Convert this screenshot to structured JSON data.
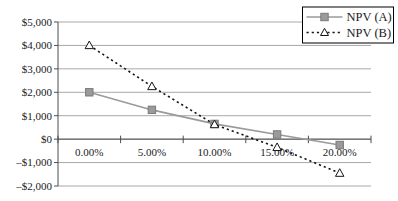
{
  "chart_data": {
    "type": "line",
    "title": "",
    "xlabel": "",
    "ylabel": "",
    "categories": [
      "0.00%",
      "5.00%",
      "10.00%",
      "15.00%",
      "20.00%"
    ],
    "series": [
      {
        "name": "NPV (A)",
        "values": [
          2000,
          1250,
          650,
          200,
          -250
        ],
        "color": "#9a9a9a",
        "marker_edge": "#7a7a7a",
        "line_style": "solid",
        "marker": "square-filled"
      },
      {
        "name": "NPV (B)",
        "values": [
          4000,
          2250,
          625,
          -350,
          -1450
        ],
        "color": "#141414",
        "marker_edge": "#141414",
        "marker_fill": "#ffffff",
        "line_style": "dotted",
        "marker": "triangle-open"
      }
    ],
    "ylim": [
      -2000,
      5000
    ],
    "ytick_step": 1000,
    "ytick_labels_top_to_bottom": [
      "$5,000",
      "$4,000",
      "$3,000",
      "$2,000",
      "$1,000",
      "$0",
      "–$1,000",
      "–$2,000"
    ],
    "grid": "horizontal-only",
    "legend_position": "top-right",
    "x_axis_crosses_at": 0
  },
  "colors": {
    "background": "#ffffff",
    "gridline": "#a8a8a8",
    "axis": "#4d4d4d",
    "text": "#1a1a1a",
    "legend_border": "#000000",
    "legend_fill": "#ffffff"
  }
}
